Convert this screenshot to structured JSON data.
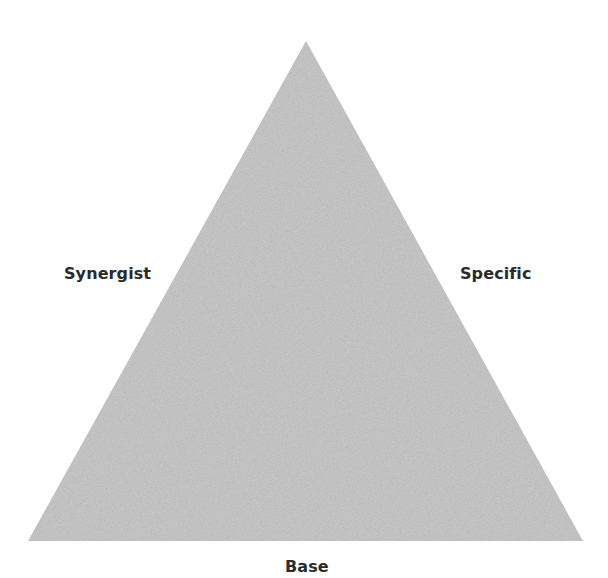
{
  "diagram": {
    "type": "triangle",
    "fill_color": "#c9c9c9",
    "text_color": "#2b2b2b",
    "vertices": {
      "apex": [
        306,
        41
      ],
      "bottom_left": [
        28,
        541
      ],
      "bottom_right": [
        583,
        541
      ]
    },
    "labels": {
      "left_side": "Synergist",
      "right_side": "Specific",
      "base": "Base"
    }
  }
}
